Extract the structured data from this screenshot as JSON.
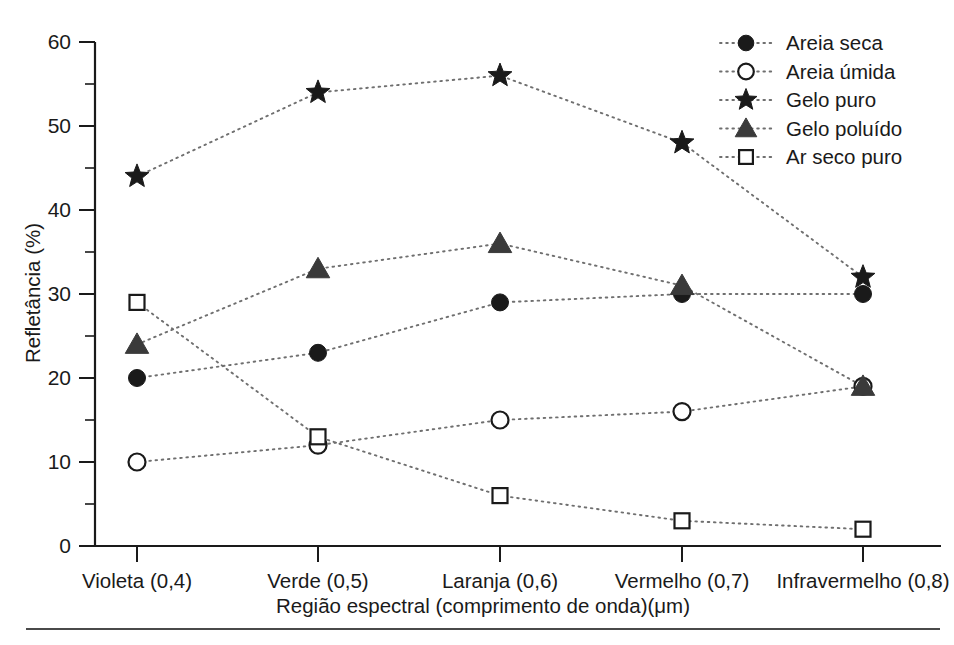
{
  "chart_data": {
    "type": "line",
    "title": "",
    "xlabel": "Região espectral (comprimento de onda)(μm)",
    "ylabel": "Refletância (%)",
    "categories": [
      "Violeta (0,4)",
      "Verde (0,5)",
      "Laranja (0,6)",
      "Vermelho (0,7)",
      "Infravermelho (0,8)"
    ],
    "ylim": [
      0,
      60
    ],
    "yticks": [
      0,
      10,
      20,
      30,
      40,
      50,
      60
    ],
    "ytick_labels": [
      "0",
      "10",
      "20",
      "30",
      "40",
      "50",
      "60"
    ],
    "yminor_ticks": [
      5,
      15,
      25,
      35,
      45,
      55
    ],
    "grid": false,
    "legend_position": "top-right",
    "series": [
      {
        "name": "Areia seca",
        "marker": "filled-circle",
        "values": [
          20,
          23,
          29,
          30,
          30
        ]
      },
      {
        "name": "Areia úmida",
        "marker": "open-circle",
        "values": [
          10,
          12,
          15,
          16,
          19
        ]
      },
      {
        "name": "Gelo puro",
        "marker": "star",
        "values": [
          44,
          54,
          56,
          48,
          32
        ]
      },
      {
        "name": "Gelo poluído",
        "marker": "filled-triangle",
        "values": [
          24,
          33,
          36,
          31,
          19
        ]
      },
      {
        "name": "Ar seco puro",
        "marker": "open-square",
        "values": [
          29,
          13,
          6,
          3,
          2
        ]
      }
    ]
  },
  "legend": {
    "entries": [
      {
        "label": "Areia seca",
        "marker": "filled-circle"
      },
      {
        "label": "Areia úmida",
        "marker": "open-circle"
      },
      {
        "label": "Gelo puro",
        "marker": "star"
      },
      {
        "label": "Gelo poluído",
        "marker": "filled-triangle"
      },
      {
        "label": "Ar seco puro",
        "marker": "open-square"
      }
    ]
  },
  "colors": {
    "axis": "#1a1a1a",
    "line": "#6f6f6f",
    "marker_fill": "#1a1a1a",
    "marker_open_fill": "#ffffff",
    "triangle_fill": "#3a3a3a",
    "background": "#ffffff"
  }
}
